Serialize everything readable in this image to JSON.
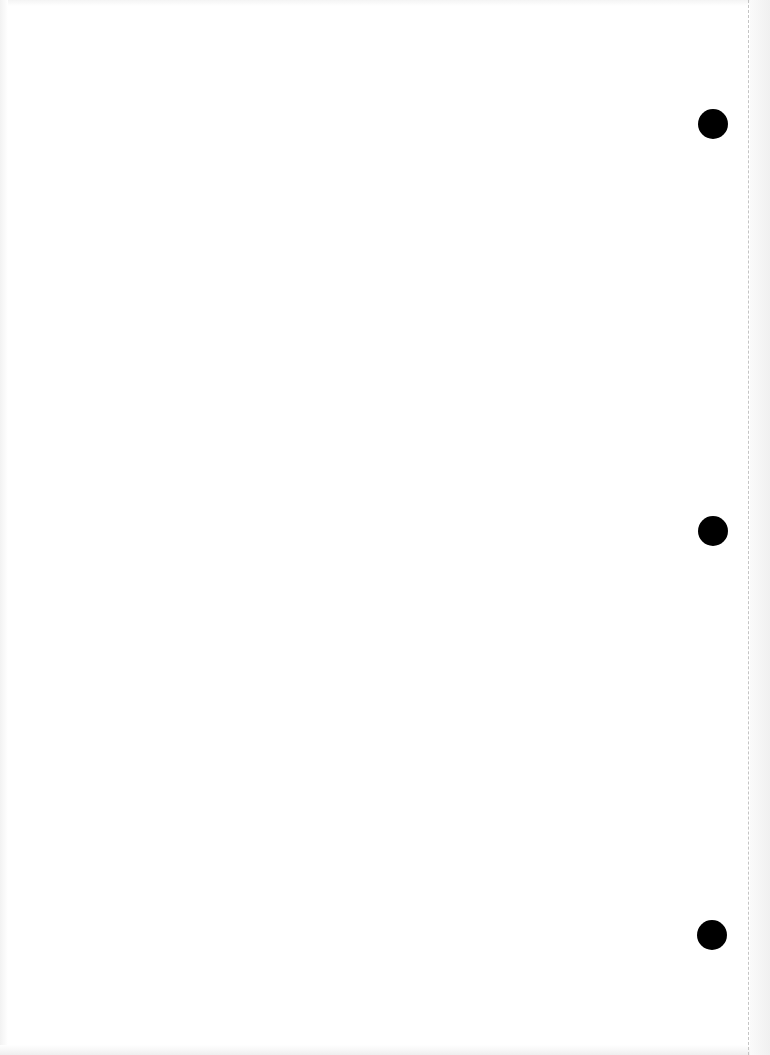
{
  "page": {
    "type": "blank scanned page",
    "background_color": "#ffffff",
    "text_content": ""
  },
  "punch_holes": [
    {
      "name": "top",
      "cx": 713,
      "cy": 124,
      "radius": 15,
      "color": "#000000"
    },
    {
      "name": "middle",
      "cx": 713,
      "cy": 531,
      "radius": 15,
      "color": "#000000"
    },
    {
      "name": "bottom",
      "cx": 712,
      "cy": 935,
      "radius": 15,
      "color": "#000000"
    }
  ],
  "perforation": {
    "x": 748,
    "style": "dashed",
    "color": "#c4c4c4"
  },
  "margin_strip": {
    "x_start": 750,
    "x_end": 770,
    "color": "#f0f0f0"
  }
}
